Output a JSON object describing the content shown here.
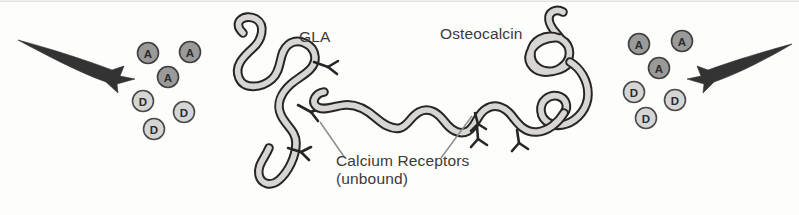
{
  "figure": {
    "kind": "scientific-diagram",
    "background_color": "#fdfdfb"
  },
  "labels": {
    "gla": "GLA",
    "osteocalcin": "Osteocalcin",
    "calcium_receptors_line1": "Calcium Receptors",
    "calcium_receptors_line2": "(unbound)"
  },
  "colors": {
    "ink": "#2b2b2b",
    "text": "#3a3a3a",
    "ribbon_fill": "#d8d6d2",
    "circle_a_fill": "#9a9a9a",
    "circle_d_fill": "#d5d5d5",
    "circle_stroke": "#4a4a4a",
    "arrow_fill": "#333333",
    "leader_line": "#8a8a8a"
  },
  "molecule_clusters": [
    {
      "name": "left-cluster",
      "circles": [
        {
          "label": "A",
          "type": "A",
          "cx": 148,
          "cy": 53,
          "r": 10.5
        },
        {
          "label": "A",
          "type": "A",
          "cx": 190,
          "cy": 52,
          "r": 10.5
        },
        {
          "label": "A",
          "type": "A",
          "cx": 168,
          "cy": 77,
          "r": 10.5
        },
        {
          "label": "D",
          "type": "D",
          "cx": 143,
          "cy": 101,
          "r": 10.5
        },
        {
          "label": "D",
          "type": "D",
          "cx": 184,
          "cy": 112,
          "r": 10.5
        },
        {
          "label": "D",
          "type": "D",
          "cx": 154,
          "cy": 129,
          "r": 10.5
        }
      ]
    },
    {
      "name": "right-cluster",
      "circles": [
        {
          "label": "A",
          "type": "A",
          "cx": 639,
          "cy": 44,
          "r": 10.5
        },
        {
          "label": "A",
          "type": "A",
          "cx": 682,
          "cy": 41,
          "r": 10.5
        },
        {
          "label": "A",
          "type": "A",
          "cx": 659,
          "cy": 68,
          "r": 10.5
        },
        {
          "label": "D",
          "type": "D",
          "cx": 634,
          "cy": 92,
          "r": 10.5
        },
        {
          "label": "D",
          "type": "D",
          "cx": 675,
          "cy": 100,
          "r": 10.5
        },
        {
          "label": "D",
          "type": "D",
          "cx": 646,
          "cy": 118,
          "r": 10.5
        }
      ]
    }
  ],
  "arrows": [
    {
      "name": "left-arrow",
      "direction": "right",
      "tail": [
        18,
        40
      ],
      "head": [
        128,
        78
      ]
    },
    {
      "name": "right-arrow",
      "direction": "left",
      "tail": [
        792,
        44
      ],
      "head": [
        694,
        78
      ]
    }
  ],
  "proteins": [
    {
      "name": "gla",
      "label": "GLA",
      "receptor_count": 3,
      "shape": "serpentine-ribbon"
    },
    {
      "name": "osteocalcin",
      "label": "Osteocalcin",
      "receptor_count": 3,
      "shape": "coiled-ribbon-with-wavy-tail"
    }
  ],
  "leader_lines": [
    {
      "name": "leader-to-gla-receptor",
      "from": [
        345,
        158
      ],
      "to": [
        320,
        122
      ]
    },
    {
      "name": "leader-to-osteocalcin-receptor",
      "from": [
        441,
        158
      ],
      "to": [
        472,
        116
      ]
    }
  ]
}
